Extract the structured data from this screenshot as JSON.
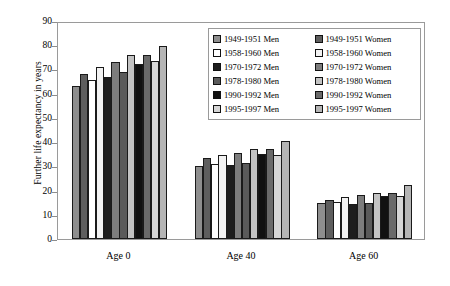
{
  "chart_data": {
    "type": "bar",
    "title": "",
    "xlabel": "",
    "ylabel": "Further life expectancy in years",
    "ylim": [
      0,
      90
    ],
    "yticks": [
      0,
      10,
      20,
      30,
      40,
      50,
      60,
      70,
      80,
      90
    ],
    "grid": false,
    "legend_position": "upper right",
    "categories": [
      "Age 0",
      "Age 40",
      "Age 60"
    ],
    "series": [
      {
        "name": "1949-1951 Men",
        "color": "#8e8e8e",
        "values": [
          63.0,
          30.0,
          14.7
        ]
      },
      {
        "name": "1949-1951 Women",
        "color": "#5e5e5e",
        "values": [
          68.0,
          33.3,
          16.3
        ]
      },
      {
        "name": "1958-1960 Men",
        "color": "#ffffff",
        "values": [
          65.8,
          30.9,
          15.3
        ]
      },
      {
        "name": "1958-1960 Women",
        "color": "#f2f2f2",
        "values": [
          71.2,
          34.8,
          17.2
        ]
      },
      {
        "name": "1970-1972 Men",
        "color": "#1d1d1d",
        "values": [
          67.0,
          30.4,
          14.4
        ]
      },
      {
        "name": "1970-1972 Women",
        "color": "#7d7d7d",
        "values": [
          73.2,
          35.5,
          18.1
        ]
      },
      {
        "name": "1978-1980 Men",
        "color": "#5a5a5a",
        "values": [
          68.9,
          31.3,
          14.8
        ]
      },
      {
        "name": "1978-1980 Women",
        "color": "#c3c3c3",
        "values": [
          75.8,
          37.2,
          19.2
        ]
      },
      {
        "name": "1990-1992 Men",
        "color": "#111111",
        "values": [
          72.4,
          34.9,
          17.8
        ]
      },
      {
        "name": "1990-1992 Women",
        "color": "#6a6a6a",
        "values": [
          75.8,
          37.3,
          19.0
        ]
      },
      {
        "name": "1995-1997 Men",
        "color": "#d6d6d6",
        "values": [
          73.3,
          34.8,
          17.8
        ]
      },
      {
        "name": "1995-1997 Women",
        "color": "#b5b5b5",
        "values": [
          79.5,
          40.5,
          22.2
        ]
      }
    ]
  }
}
